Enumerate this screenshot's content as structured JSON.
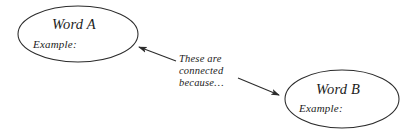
{
  "diagram": {
    "type": "concept-map",
    "background_color": "#ffffff",
    "stroke_color": "#2b2b2b",
    "text_color": "#1c1c1c",
    "nodes": [
      {
        "id": "word-a",
        "title": "Word A",
        "example_label": "Example:",
        "shape": "ellipse",
        "center_x": 78,
        "center_y": 34,
        "radius_x": 60,
        "radius_y": 28
      },
      {
        "id": "word-b",
        "title": "Word B",
        "example_label": "Example:",
        "shape": "ellipse",
        "center_x": 342,
        "center_y": 99,
        "radius_x": 57,
        "radius_y": 29
      }
    ],
    "connector": {
      "label_lines": [
        "These are",
        "connected",
        "because…"
      ],
      "arrows": [
        {
          "id": "arrow-to-word-a",
          "from_x": 176,
          "from_y": 61,
          "to_x": 137,
          "to_y": 46,
          "points_to": "word-a"
        },
        {
          "id": "arrow-to-word-b",
          "from_x": 238,
          "from_y": 78,
          "to_x": 282,
          "to_y": 96,
          "points_to": "word-b"
        }
      ]
    }
  }
}
